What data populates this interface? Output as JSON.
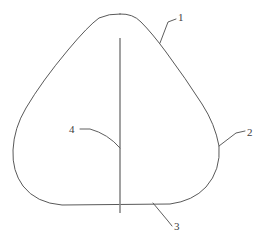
{
  "figure": {
    "type": "technical-line-drawing",
    "width": 269,
    "height": 245,
    "background_color": "#ffffff",
    "outline_color": "#595959",
    "centerline_color": "#8a8a8a",
    "leader_color": "#5e5e5e",
    "label_color": "#3d3d3d"
  },
  "callouts": [
    {
      "id": "1",
      "label": "1",
      "points_to": "upper-right-flank-of-outline",
      "leader_path": "M 176 19 L 168 22 L 160 43"
    },
    {
      "id": "2",
      "label": "2",
      "points_to": "right-side-of-outline",
      "leader_path": "M 245 131 L 236 133 L 219 146"
    },
    {
      "id": "3",
      "label": "3",
      "points_to": "bottom-edge-of-outline",
      "leader_path": "M 172 226 L 168 221 L 153 203"
    },
    {
      "id": "4",
      "label": "4",
      "points_to": "vertical-centerline",
      "leader_path": "M 80 129 L 90 129 Q 108 134 120 148"
    }
  ],
  "geometry": {
    "outline_path": "M 120 14 Q 133 13.5 141 22 Q 152 33 166 52 Q 186 79 202 104 Q 215 124 219 146 Q 221 170 206 187 Q 193 201 170 204 L 62 205 Q 36 203 23 186 Q 12 171 13 150 Q 14 128 26 108 Q 42 81 68 50 Q 88 26 99 18 Q 109 13.5 120 14 Z",
    "centerline_path": "M 120 38 L 120 213"
  }
}
